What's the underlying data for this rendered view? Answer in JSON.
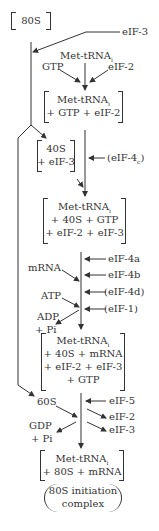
{
  "diagram": {
    "nodes": {
      "ribosome80s": "80S",
      "eif3_in": "eIF-3",
      "met_trna": "Met-tRNA",
      "met_trna_sub": "i",
      "gtp": "GTP",
      "eif2_in": "eIF-2",
      "ternary": [
        "Met-tRNA",
        "+ GTP + eIF-2"
      ],
      "s40": [
        "40S",
        "+ eIF-3"
      ],
      "eif4c": "(eIF-4",
      "eif4c_sub": "c",
      "eif4c_close": ")",
      "preinit": [
        "Met-tRNA",
        "+ 40S + GTP",
        "+ eIF-2 + eIF-3"
      ],
      "mrna": "mRNA",
      "eif4a": "eIF-4a",
      "eif4b": "eIF-4b",
      "eif4d": "(eIF-4d)",
      "eif1": "(eIF-1)",
      "atp": "ATP",
      "adp": "ADP",
      "pi1": "+ Pi",
      "initcomplex40": [
        "Met-tRNA",
        "+ 40S + mRNA",
        "+ eIF-2 + eIF-3",
        "+ GTP"
      ],
      "s60": "60S",
      "eif5": "eIF-5",
      "eif2_out": "eIF-2",
      "eif3_out": "eIF-3",
      "gdp": "GDP",
      "pi2": "+ Pi",
      "final": [
        "Met-tRNA",
        "+ 80S + mRNA"
      ],
      "final_label": [
        "80S initiation",
        "complex"
      ]
    }
  }
}
